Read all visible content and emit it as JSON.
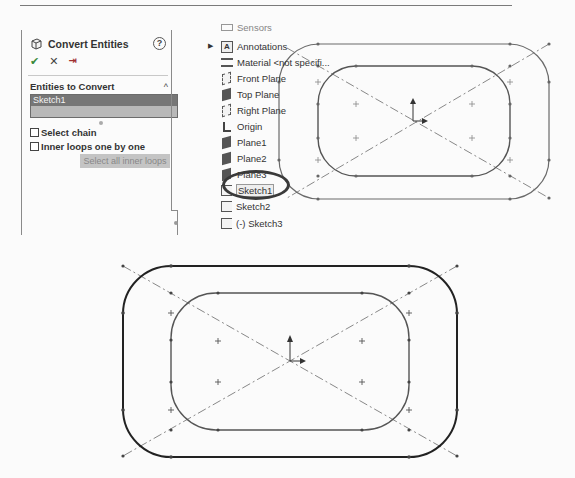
{
  "property_manager": {
    "title": "Convert Entities",
    "help_icon": "?",
    "actions": {
      "ok": "✔",
      "cancel": "✕",
      "pin": "⇥"
    },
    "group": {
      "title": "Entities to Convert",
      "collapse_icon": "^",
      "selection_items": [
        "Sketch1"
      ]
    },
    "options": [
      {
        "label": "Select chain",
        "checked": false
      },
      {
        "label": "Inner loops one by one",
        "checked": false
      }
    ],
    "select_all_button": "Select all inner loops"
  },
  "feature_tree": {
    "items": [
      {
        "label": "Sensors",
        "icon": "sensors-icon"
      },
      {
        "label": "Annotations",
        "icon": "annotations-icon",
        "expandable": true
      },
      {
        "label": "Material <not specifi...",
        "icon": "material-icon"
      },
      {
        "label": "Front Plane",
        "icon": "plane-icon"
      },
      {
        "label": "Top Plane",
        "icon": "plane-icon"
      },
      {
        "label": "Right Plane",
        "icon": "plane-icon"
      },
      {
        "label": "Origin",
        "icon": "origin-icon"
      },
      {
        "label": "Plane1",
        "icon": "plane-icon"
      },
      {
        "label": "Plane2",
        "icon": "plane-icon"
      },
      {
        "label": "Plane3",
        "icon": "plane-icon"
      },
      {
        "label": "Sketch1",
        "icon": "sketch-icon",
        "highlighted": true
      },
      {
        "label": "Sketch2",
        "icon": "sketch-icon"
      },
      {
        "label": "(-) Sketch3",
        "icon": "sketch-icon"
      }
    ]
  },
  "colors": {
    "selection_dark": "#767676",
    "selection_light": "#b8b8b8",
    "sketch_line": "#555555",
    "sketch_bold": "#222222",
    "centerline": "#777777"
  }
}
